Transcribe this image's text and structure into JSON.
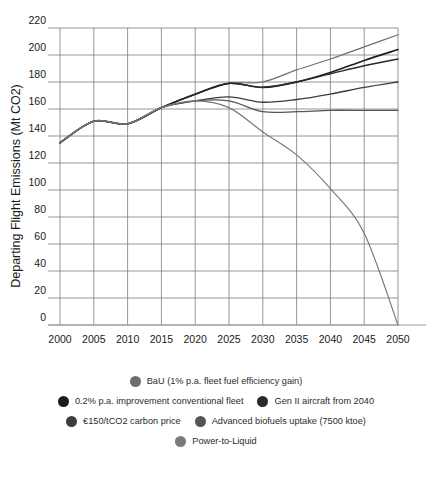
{
  "chart_data": {
    "type": "line",
    "title": "",
    "xlabel": "",
    "ylabel": "Departing Flight Emissions (Mt CO2)",
    "xlim": [
      2000,
      2050
    ],
    "ylim": [
      0,
      220
    ],
    "ytick_step": 20,
    "grid": true,
    "legend_position": "bottom",
    "x": [
      2000,
      2005,
      2010,
      2015,
      2020,
      2025,
      2030,
      2035,
      2040,
      2045,
      2050
    ],
    "xticks": [
      "2000",
      "2005",
      "2010",
      "2015",
      "2020",
      "2025",
      "2030",
      "2035",
      "2040",
      "2045",
      "2050"
    ],
    "yticks": [
      "0",
      "20",
      "40",
      "60",
      "80",
      "100",
      "120",
      "140",
      "160",
      "180",
      "200",
      "220"
    ],
    "series": [
      {
        "name": "BaU (1% p.a. fleet fuel efficiency gain)",
        "color": "#6e6e6e",
        "width": 1.2,
        "values": [
          135,
          151,
          149,
          161,
          171,
          179,
          180,
          189,
          197,
          206,
          215
        ]
      },
      {
        "name": "0.2% p.a. improvement conventional fleet",
        "color": "#1c1c1c",
        "width": 1.6,
        "values": [
          135,
          151,
          149,
          161,
          171,
          179,
          176,
          180,
          187,
          196,
          204
        ]
      },
      {
        "name": "Gen II aircraft from 2040",
        "color": "#2a2a2a",
        "width": 1.4,
        "values": [
          135,
          151,
          149,
          161,
          171,
          179,
          176,
          180,
          186,
          192,
          197
        ]
      },
      {
        "name": "€150/tCO2 carbon price",
        "color": "#3d3d3d",
        "width": 1.4,
        "values": [
          135,
          151,
          149,
          161,
          166,
          169,
          165,
          167,
          171,
          176,
          180
        ]
      },
      {
        "name": "Advanced biofuels uptake (7500 ktoe)",
        "color": "#555555",
        "width": 1.3,
        "values": [
          135,
          151,
          149,
          161,
          166,
          166,
          158,
          158,
          159,
          159,
          159
        ]
      },
      {
        "name": "Power-to-Liquid",
        "color": "#7a7a7a",
        "width": 1.2,
        "values": [
          135,
          151,
          149,
          161,
          166,
          161,
          143,
          126,
          101,
          68,
          0
        ]
      }
    ]
  },
  "axes": {
    "ylabel": "Departing Flight Emissions (Mt CO2)"
  },
  "legend": {
    "rows": [
      [
        {
          "label": "BaU (1% p.a. fleet fuel efficiency gain)",
          "color": "#6e6e6e"
        }
      ],
      [
        {
          "label": "0.2% p.a. improvement conventional fleet",
          "color": "#1c1c1c"
        },
        {
          "label": "Gen II aircraft from 2040",
          "color": "#2a2a2a"
        }
      ],
      [
        {
          "label": "€150/tCO2 carbon price",
          "color": "#3d3d3d"
        },
        {
          "label": "Advanced biofuels uptake (7500 ktoe)",
          "color": "#555555"
        }
      ],
      [
        {
          "label": "Power-to-Liquid",
          "color": "#7a7a7a"
        }
      ]
    ]
  },
  "caption": {
    "text": ""
  },
  "colors": {
    "grid": "#7c7c7c",
    "axis": "#9a9a9a",
    "text": "#1a1a1a",
    "background": "#ffffff"
  }
}
